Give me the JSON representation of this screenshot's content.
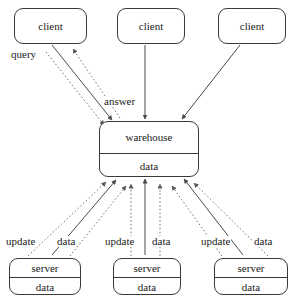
{
  "diagram": {
    "type": "node-edge-diagram",
    "canvas": {
      "width": 297,
      "height": 298
    },
    "colors": {
      "background": "#ffffff",
      "stroke": "#3a3a3a",
      "text": "#1a1a1a",
      "edge_solid": "#4a4a4a",
      "edge_dotted": "#777777"
    },
    "nodes": [
      {
        "id": "client-left",
        "label": "client",
        "rows": [
          "client"
        ],
        "x": 14,
        "y": 8,
        "w": 73,
        "h": 36
      },
      {
        "id": "client-middle",
        "label": "client",
        "rows": [
          "client"
        ],
        "x": 117,
        "y": 8,
        "w": 68,
        "h": 36
      },
      {
        "id": "client-right",
        "label": "client",
        "rows": [
          "client"
        ],
        "x": 218,
        "y": 8,
        "w": 68,
        "h": 36
      },
      {
        "id": "warehouse",
        "label": "warehouse",
        "rows": [
          "warehouse",
          "data"
        ],
        "x": 99,
        "y": 121,
        "w": 100,
        "h": 56
      },
      {
        "id": "server-left",
        "label": "server",
        "rows": [
          "server",
          "data"
        ],
        "x": 9,
        "y": 258,
        "w": 72,
        "h": 37
      },
      {
        "id": "server-middle",
        "label": "server",
        "rows": [
          "server",
          "data"
        ],
        "x": 113,
        "y": 258,
        "w": 68,
        "h": 37
      },
      {
        "id": "server-right",
        "label": "server",
        "rows": [
          "server",
          "data"
        ],
        "x": 214,
        "y": 258,
        "w": 74,
        "h": 37
      }
    ],
    "edge_labels": [
      {
        "id": "query",
        "text": "query",
        "x": 10,
        "y": 49
      },
      {
        "id": "answer",
        "text": "answer",
        "x": 103,
        "y": 96
      },
      {
        "id": "update-left",
        "text": "update",
        "x": 5,
        "y": 236
      },
      {
        "id": "data-left",
        "text": "data",
        "x": 56,
        "y": 236
      },
      {
        "id": "update-middle",
        "text": "update",
        "x": 104,
        "y": 236
      },
      {
        "id": "data-middle",
        "text": "data",
        "x": 151,
        "y": 236
      },
      {
        "id": "update-right",
        "text": "update",
        "x": 200,
        "y": 236
      },
      {
        "id": "data-right",
        "text": "data",
        "x": 253,
        "y": 236
      }
    ],
    "edges": [
      {
        "id": "query-edge",
        "style": "solid",
        "from": "client-left",
        "to": "warehouse",
        "label": "query"
      },
      {
        "id": "answer-edge",
        "style": "dotted",
        "from": "warehouse",
        "to": "client-left",
        "label": "answer"
      },
      {
        "id": "client-left-dotted-down",
        "style": "dotted",
        "from": "client-left",
        "to": "warehouse",
        "label": ""
      },
      {
        "id": "client-middle-edge",
        "style": "solid",
        "from": "client-middle",
        "to": "warehouse",
        "label": ""
      },
      {
        "id": "client-right-edge",
        "style": "solid",
        "from": "client-right",
        "to": "warehouse",
        "label": ""
      },
      {
        "id": "server-left-update",
        "style": "dotted",
        "from": "server-left",
        "to": "warehouse",
        "label": "update"
      },
      {
        "id": "server-left-data",
        "style": "solid",
        "from": "server-left",
        "to": "warehouse",
        "label": "data"
      },
      {
        "id": "server-left-data-dotted",
        "style": "dotted",
        "from": "server-left",
        "to": "warehouse",
        "label": ""
      },
      {
        "id": "server-middle-update",
        "style": "dotted",
        "from": "server-middle",
        "to": "warehouse",
        "label": "update"
      },
      {
        "id": "server-middle-data",
        "style": "solid",
        "from": "server-middle",
        "to": "warehouse",
        "label": "data"
      },
      {
        "id": "server-middle-data-dotted",
        "style": "dotted",
        "from": "server-middle",
        "to": "warehouse",
        "label": ""
      },
      {
        "id": "server-right-update",
        "style": "dotted",
        "from": "server-right",
        "to": "warehouse",
        "label": "update"
      },
      {
        "id": "server-right-data",
        "style": "solid",
        "from": "server-right",
        "to": "warehouse",
        "label": "data"
      },
      {
        "id": "server-right-data-dotted",
        "style": "dotted",
        "from": "server-right",
        "to": "warehouse",
        "label": ""
      }
    ]
  }
}
